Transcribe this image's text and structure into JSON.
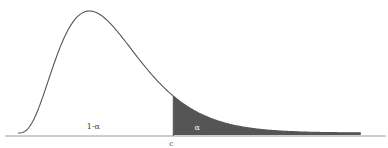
{
  "chart_data": {
    "type": "area",
    "title": "",
    "xlabel": "",
    "ylabel": "",
    "distribution": {
      "family": "right-skewed density",
      "mode_x": 2.0,
      "shape": 4.0
    },
    "x_range": [
      0,
      10
    ],
    "critical_value": 4.35,
    "critical_label": "c",
    "regions": [
      {
        "name": "acceptance",
        "label": "1-α",
        "from": 0,
        "to": 4.35,
        "shaded": false
      },
      {
        "name": "rejection",
        "label": "α",
        "from": 4.35,
        "to": 9.6,
        "shaded": true
      }
    ],
    "grid": false,
    "legend": "none"
  },
  "colors": {
    "curve": "#555555",
    "shade": "#555555",
    "axis": "#9a9a9a",
    "background": "#ffffff"
  }
}
